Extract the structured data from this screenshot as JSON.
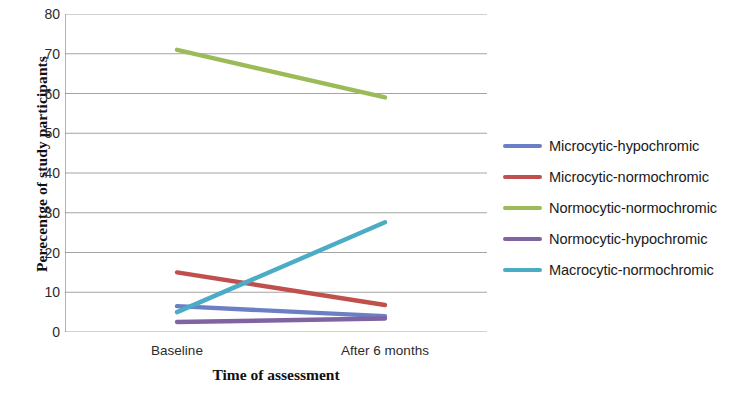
{
  "chart_data": {
    "type": "line",
    "title": "",
    "xlabel": "Time of assessment",
    "ylabel": "Perecentge of study participants",
    "categories": [
      "Baseline",
      "After 6 months"
    ],
    "x": [
      0,
      1
    ],
    "ylim": [
      0,
      80
    ],
    "yticks": [
      0,
      10,
      20,
      30,
      40,
      50,
      60,
      70,
      80
    ],
    "ytick_labels": [
      "0",
      "10",
      "20",
      "30",
      "40",
      "50",
      "60",
      "70",
      "80"
    ],
    "grid": "horizontal",
    "legend_position": "right",
    "series": [
      {
        "name": "Microcytic-hypochromic",
        "color": "#6b7fc7",
        "values": [
          6.5,
          4.0
        ]
      },
      {
        "name": "Microcytic-normochromic",
        "color": "#c0504d",
        "values": [
          15.0,
          6.8
        ]
      },
      {
        "name": "Normocytic-normochromic",
        "color": "#9bbb59",
        "values": [
          71.0,
          59.0
        ]
      },
      {
        "name": "Normocytic-hypochromic",
        "color": "#8064a2",
        "values": [
          2.5,
          3.4
        ]
      },
      {
        "name": "Macrocytic-normochromic",
        "color": "#4bacc6",
        "values": [
          5.0,
          27.6
        ]
      }
    ]
  },
  "axis": {
    "line_color": "#808080",
    "grid_color": "#9a9a9a"
  }
}
